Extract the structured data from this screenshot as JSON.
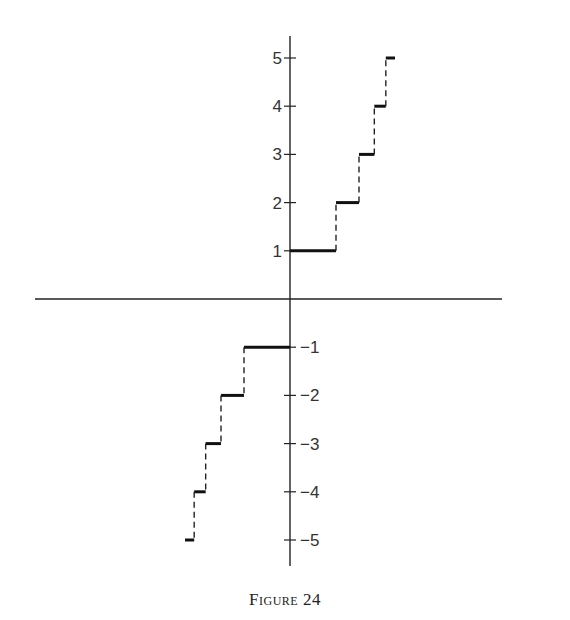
{
  "caption": "Figure 24",
  "chart_data": {
    "type": "line",
    "subtype": "step-function",
    "title": "Figure 24",
    "xlabel": "",
    "ylabel": "",
    "x_ticks": [],
    "y_ticks": [
      5,
      4,
      3,
      2,
      1,
      -1,
      -2,
      -3,
      -4,
      -5
    ],
    "ylim": [
      -5.5,
      5.5
    ],
    "grid": false,
    "legend": null,
    "segments": [
      {
        "y": 1,
        "x_start": 0.0,
        "x_end": 1.0
      },
      {
        "y": 2,
        "x_start": 1.0,
        "x_end": 1.5
      },
      {
        "y": 3,
        "x_start": 1.5,
        "x_end": 1.833
      },
      {
        "y": 4,
        "x_start": 1.833,
        "x_end": 2.083
      },
      {
        "y": 5,
        "x_start": 2.083,
        "x_end": 2.283
      },
      {
        "y": -1,
        "x_start": -1.0,
        "x_end": 0.0
      },
      {
        "y": -2,
        "x_start": -1.5,
        "x_end": -1.0
      },
      {
        "y": -3,
        "x_start": -1.833,
        "x_end": -1.5
      },
      {
        "y": -4,
        "x_start": -2.083,
        "x_end": -1.833
      },
      {
        "y": -5,
        "x_start": -2.283,
        "x_end": -2.083
      }
    ]
  },
  "layout": {
    "origin_px": [
      290,
      299
    ],
    "x_unit_px": 46,
    "y_unit_px": 48.2,
    "x_axis_px": [
      35,
      502
    ],
    "y_axis_px": [
      36,
      566
    ]
  }
}
